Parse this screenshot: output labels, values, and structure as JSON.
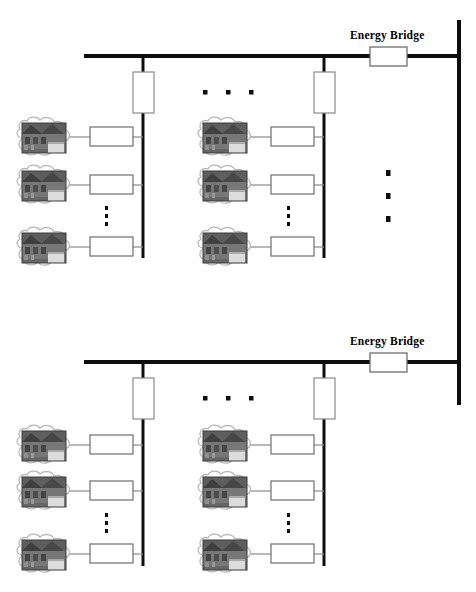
{
  "diagram": {
    "colors": {
      "bus": "#0d0d0d",
      "feeder_line": "#8a8a8a",
      "box_stroke": "#6e6e6e",
      "box_fill": "#ffffff",
      "dot": "#0d0d0d",
      "cloud_stroke": "#b3b3b3",
      "cloud_fill": "#ffffff",
      "label_text": "#000000",
      "house_roof": "#4a4a4a",
      "house_wall": "#6b6b6b",
      "house_door": "#d8d8d8"
    },
    "labels": {
      "energy_bridge": "Energy Bridge"
    },
    "icons": {
      "house": "house-photo-icon",
      "cloud": "cloud-outline-icon",
      "meter": "meter-box-icon",
      "transformer": "transformer-box-icon",
      "bridge": "energy-bridge-box-icon",
      "h_ellipsis": "horizontal-ellipsis-icon",
      "v_ellipsis": "vertical-ellipsis-icon"
    },
    "sections": [
      {
        "name": "upper-feeder",
        "bridge_label": "Energy Bridge",
        "main_bus_y": 56,
        "main_bus_x1": 84,
        "main_bus_x2": 459,
        "bridge_box": {
          "x": 370,
          "y": 47,
          "w": 37,
          "h": 19
        },
        "bridge_label_pos": {
          "x": 350,
          "y": 30
        },
        "columns": [
          {
            "name": "column-left",
            "bus_x": 143,
            "bus_y1": 56,
            "bus_y2": 258,
            "transformer": {
              "x": 133,
              "y": 72,
              "w": 21,
              "h": 41
            },
            "customers": [
              {
                "name": "customer-1",
                "y": 137
              },
              {
                "name": "customer-2",
                "y": 185
              },
              {
                "name": "customer-3",
                "y": 247
              }
            ],
            "ellipsis": {
              "x": 107,
              "y": 213,
              "dots": 3
            }
          },
          {
            "name": "column-middle",
            "bus_x": 324,
            "bus_y1": 56,
            "bus_y2": 258,
            "transformer": {
              "x": 314,
              "y": 72,
              "w": 21,
              "h": 41
            },
            "customers": [
              {
                "name": "customer-1",
                "y": 137
              },
              {
                "name": "customer-2",
                "y": 185
              },
              {
                "name": "customer-3",
                "y": 247
              }
            ],
            "ellipsis": {
              "x": 289,
              "y": 213,
              "dots": 3
            }
          }
        ],
        "column_ellipsis": {
          "x": 205,
          "y": 92,
          "dots": 3,
          "spacing": 23
        },
        "bus_ellipsis": {
          "x": 388,
          "y": 172,
          "dots": 3,
          "spacing": 23
        }
      },
      {
        "name": "lower-feeder",
        "bridge_label": "Energy Bridge",
        "main_bus_y": 362,
        "main_bus_x1": 84,
        "main_bus_x2": 459,
        "bridge_box": {
          "x": 370,
          "y": 353,
          "w": 37,
          "h": 19
        },
        "bridge_label_pos": {
          "x": 350,
          "y": 336
        },
        "columns": [
          {
            "name": "column-left",
            "bus_x": 143,
            "bus_y1": 362,
            "bus_y2": 566,
            "transformer": {
              "x": 133,
              "y": 378,
              "w": 21,
              "h": 41
            },
            "customers": [
              {
                "name": "customer-1",
                "y": 445
              },
              {
                "name": "customer-2",
                "y": 491
              },
              {
                "name": "customer-3",
                "y": 554
              }
            ],
            "ellipsis": {
              "x": 107,
              "y": 520,
              "dots": 3
            }
          },
          {
            "name": "column-middle",
            "bus_x": 324,
            "bus_y1": 362,
            "bus_y2": 566,
            "transformer": {
              "x": 314,
              "y": 378,
              "w": 21,
              "h": 41
            },
            "customers": [
              {
                "name": "customer-1",
                "y": 445
              },
              {
                "name": "customer-2",
                "y": 491
              },
              {
                "name": "customer-3",
                "y": 554
              }
            ],
            "ellipsis": {
              "x": 289,
              "y": 520,
              "dots": 3
            }
          }
        ],
        "column_ellipsis": {
          "x": 205,
          "y": 398,
          "dots": 3,
          "spacing": 23
        },
        "bus_ellipsis": null
      }
    ],
    "right_bus": {
      "name": "right-vertical-bus",
      "x": 459,
      "y1": 20,
      "y2": 405
    },
    "geometry": {
      "cloud_cx": 44,
      "cloud_w": 62,
      "cloud_h": 44,
      "meter_w": 43,
      "meter_h": 19,
      "meter_left_x": 90,
      "meter_mid_x": 271,
      "cloud_mid_cx": 225
    }
  }
}
